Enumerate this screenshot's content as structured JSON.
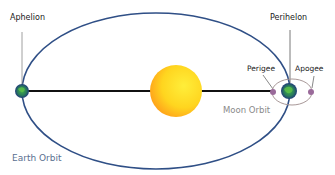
{
  "labels": {
    "aphelion": "Aphelion",
    "perihelon": "Perihelon",
    "perigee": "Perigee",
    "apogee": "Apogee",
    "moon_orbit": "Moon Orbit",
    "earth_orbit": "Earth Orbit"
  },
  "colors": {
    "earth_orbit": "#2f4f86",
    "moon_orbit": "#a09090",
    "sun_inner": "#ffe21a",
    "sun_outer": "#ffa31a",
    "axis_line": "#111111",
    "moon_dot": "#9a6a9a",
    "earth_land": "#3aa33a",
    "earth_water": "#1a2f8a"
  }
}
